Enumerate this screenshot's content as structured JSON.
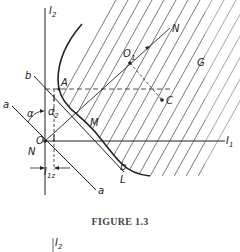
{
  "figure": {
    "caption": "FIGURE 1.3",
    "labels": {
      "axis_y": "I",
      "axis_y_sub": "2",
      "axis_x": "I",
      "axis_x_sub": "1",
      "origin": "O",
      "origin_n": "N",
      "point_a": "A",
      "point_m": "M",
      "point_o1": "O",
      "point_o1_sub": "1",
      "point_n": "N",
      "point_c": "C",
      "region_g": "G",
      "line_b_top": "b",
      "line_b_bottom": "b",
      "line_a_top": "a",
      "line_a_bottom": "a",
      "curve_l": "L",
      "angle": "α",
      "dist_d": "d",
      "dist_d_sub": "2",
      "dist_i": "I",
      "dist_i_sub": "1z"
    }
  },
  "next_figure": {
    "axis_label": "I",
    "axis_label_sub": "2"
  }
}
